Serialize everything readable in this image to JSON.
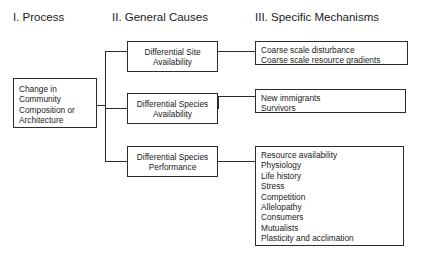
{
  "columns": [
    {
      "id": "process",
      "title": "I. Process"
    },
    {
      "id": "causes",
      "title": "II. General Causes"
    },
    {
      "id": "mechanisms",
      "title": "III. Specific Mechanisms"
    }
  ],
  "root_box": {
    "lines": [
      "Change in",
      "Community",
      "Composition or",
      "Architecture"
    ]
  },
  "general_causes": [
    {
      "id": "differential-site-availability",
      "lines": [
        "Differential Site",
        "Availability"
      ]
    },
    {
      "id": "differential-species-availability",
      "lines": [
        "Differential Species",
        "Availability"
      ]
    },
    {
      "id": "differential-species-performance",
      "lines": [
        "Differential Species",
        "Performance"
      ]
    }
  ],
  "specific_mechanisms": [
    {
      "id": "site-availability-mechanisms",
      "items": [
        "Coarse scale disturbance",
        "Coarse scale resource gradients"
      ]
    },
    {
      "id": "species-availability-mechanisms",
      "items": [
        "New immigrants",
        "Survivors"
      ]
    },
    {
      "id": "species-performance-mechanisms",
      "items": [
        "Resource availability",
        "Physiology",
        "Life history",
        "Stress",
        "Competition",
        "Allelopathy",
        "Consumers",
        "Mutualists",
        "Plasticity and acclimation"
      ]
    }
  ],
  "colors": {
    "background": "#ffffff",
    "border": "#2b2b2b",
    "text": "#1a1a1a"
  }
}
